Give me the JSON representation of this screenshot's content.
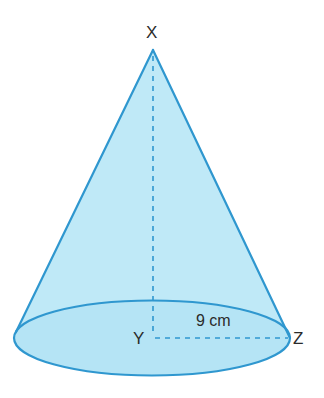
{
  "figure": {
    "type": "cone",
    "fill_color": "#bfe9f7",
    "edge_color": "#2f97cf",
    "dash_color": "#2f97cf",
    "text_color": "#2b2b2b"
  },
  "labels": {
    "apex": "X",
    "center": "Y",
    "rim_point": "Z",
    "radius": "9 cm"
  },
  "measurements": {
    "radius_value": 9,
    "radius_unit": "cm"
  }
}
